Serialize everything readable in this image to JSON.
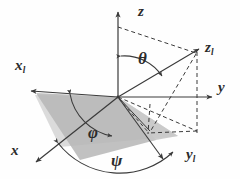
{
  "figure": {
    "type": "euler-angle-diagram",
    "background_color": "#fefefe",
    "line_color": "#3a3a3a",
    "plane_dark_color": "#b6b6b6",
    "plane_light_color": "#d9d9d9",
    "label_color": "#2b2b2b"
  },
  "labels": {
    "z": {
      "base": "z",
      "sub": ""
    },
    "y": {
      "base": "y",
      "sub": ""
    },
    "x": {
      "base": "x",
      "sub": ""
    },
    "z1": {
      "base": "z",
      "sub": "l"
    },
    "y1": {
      "base": "y",
      "sub": "l"
    },
    "x1": {
      "base": "x",
      "sub": "l"
    },
    "theta": {
      "base": "θ",
      "sub": ""
    },
    "phi": {
      "base": "φ",
      "sub": ""
    },
    "psi": {
      "base": "ψ",
      "sub": ""
    }
  },
  "angles": {
    "theta": {
      "symbol": "θ",
      "name": "nutation",
      "between": [
        "z",
        "z_l"
      ]
    },
    "phi": {
      "symbol": "φ",
      "name": "precession",
      "between": [
        "x",
        "line-of-nodes"
      ]
    },
    "psi": {
      "symbol": "ψ",
      "name": "spin",
      "between": [
        "line-of-nodes",
        "x_l"
      ]
    }
  },
  "axes": [
    {
      "id": "z",
      "kind": "fixed",
      "style": "solid",
      "label": "z"
    },
    {
      "id": "y",
      "kind": "fixed",
      "style": "solid",
      "label": "y"
    },
    {
      "id": "x",
      "kind": "fixed",
      "style": "solid",
      "label": "x"
    },
    {
      "id": "z_l",
      "kind": "rotated",
      "style": "solid",
      "label": "zl"
    },
    {
      "id": "y_l",
      "kind": "rotated",
      "style": "solid",
      "label": "yl"
    },
    {
      "id": "x_l",
      "kind": "rotated",
      "style": "solid",
      "label": "xl"
    }
  ]
}
